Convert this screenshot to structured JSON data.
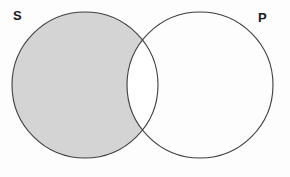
{
  "diagram": {
    "width": 290,
    "height": 177,
    "background_color": "#fdfdfd",
    "stroke_color": "#3d3d42",
    "stroke_width": 1.1,
    "shade_color": "#d4d4d4",
    "unshaded_color": "#ffffff",
    "labels": {
      "left_circle": "S",
      "right_circle": "P"
    },
    "circles": [
      {
        "id": "circle-s",
        "label": "S",
        "cx": 85,
        "cy": 85,
        "r": 73,
        "fill": "#d4d4d4",
        "filled": true
      },
      {
        "id": "circle-p",
        "label": "P",
        "cx": 200,
        "cy": 85,
        "r": 73,
        "fill": "#ffffff",
        "filled": false
      }
    ],
    "regions": [
      {
        "id": "region-s-only",
        "name": "S only",
        "shaded": true,
        "fill": "#d4d4d4"
      },
      {
        "id": "region-intersection",
        "name": "S and P",
        "shaded": false,
        "fill": "#ffffff"
      },
      {
        "id": "region-p-only",
        "name": "P only",
        "shaded": false,
        "fill": "#ffffff"
      }
    ],
    "bleed_marks": [
      {
        "left": 38,
        "top": 33,
        "width": 86
      },
      {
        "left": 150,
        "top": 33,
        "width": 96
      },
      {
        "left": 28,
        "top": 46,
        "width": 96
      },
      {
        "left": 152,
        "top": 46,
        "width": 92
      },
      {
        "left": 160,
        "top": 59,
        "width": 74
      },
      {
        "left": 20,
        "top": 146,
        "width": 36
      },
      {
        "left": 236,
        "top": 146,
        "width": 40
      }
    ]
  }
}
